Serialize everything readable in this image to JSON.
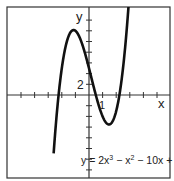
{
  "chart_data": {
    "type": "line",
    "title": "",
    "xlabel": "x",
    "ylabel": "y",
    "equation": "y = 2x³ − x² − 10x + 5",
    "equation_parts": {
      "prefix": "y = ",
      "body": "2x",
      "e1": "3",
      "mid1": " − x",
      "e2": "2",
      "tail": " − 10x + 5"
    },
    "x_tick_step": 1,
    "y_tick_step": 2,
    "tick_labels": {
      "x": "1",
      "y": "2"
    },
    "xlim": [
      -6,
      6
    ],
    "ylim": [
      -16,
      16
    ],
    "grid": false,
    "series": [
      {
        "name": "y = 2x^3 - x^2 - 10x + 5",
        "x": [
          -2.8,
          -2.5,
          -2.2,
          -2.0,
          -1.5,
          -1.15,
          -1.0,
          -0.5,
          0,
          0.5,
          1.0,
          1.5,
          1.48,
          2.0,
          2.5,
          3.0
        ],
        "values": [
          -33.2,
          -18.5,
          -8.7,
          -3.0,
          7.5,
          12.2,
          12.0,
          9.5,
          5.0,
          0.0,
          -4.0,
          -5.5,
          -5.5,
          -3.0,
          4.0,
          17.0
        ]
      }
    ],
    "critical_points": {
      "local_max": [
        -1.15,
        12.2
      ],
      "local_min": [
        1.48,
        -5.5
      ]
    },
    "color": "#111111"
  }
}
